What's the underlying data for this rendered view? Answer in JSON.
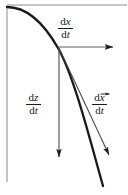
{
  "figure": {
    "name": "derivative-vector-decomposition-diagram",
    "type": "vector-decomposition",
    "background_color": "#ffffff",
    "ink_color": "#1a1a1a",
    "axis_color": "#6e6e6e",
    "width": 128,
    "height": 195
  },
  "labels": {
    "horizontal_component": {
      "numerator_d": "d",
      "numerator_var": "x",
      "denominator_d": "d",
      "denominator_var": "t",
      "text": "dx/dt"
    },
    "vertical_component": {
      "numerator_d": "d",
      "numerator_var": "z",
      "denominator_d": "d",
      "denominator_var": "t",
      "text": "dz/dt"
    },
    "tangent_vector": {
      "numerator_d": "d",
      "numerator_var": "x",
      "denominator_d": "d",
      "denominator_var": "t",
      "text": "dx⃗/dt",
      "has_vector_arrow": true
    }
  },
  "graphics": {
    "curve": {
      "name": "trajectory-curve",
      "stroke_width": 2.2,
      "path": "M 7 7 C 24 7 42 20 58 48 C 74 76 90 140 103 186"
    },
    "vertical_axis": {
      "name": "vertical-axis-line",
      "stroke_width": 1,
      "x": 7,
      "y_top": 7,
      "y_bottom": 182
    },
    "top_axis": {
      "name": "top-horizontal-line",
      "stroke_width": 1,
      "y": 5,
      "x_left": 7,
      "x_right": 127
    },
    "horizontal_arrow": {
      "name": "dx-dt-arrow",
      "from_x": 59,
      "from_y": 47,
      "to_x": 120,
      "to_y": 47
    },
    "vertical_arrow": {
      "name": "dz-dt-arrow",
      "from_x": 59,
      "from_y": 48,
      "to_x": 59,
      "to_y": 164
    },
    "tangent_arrow": {
      "name": "dvecx-dt-arrow",
      "from_x": 59,
      "from_y": 48,
      "to_x": 114,
      "to_y": 161
    }
  }
}
